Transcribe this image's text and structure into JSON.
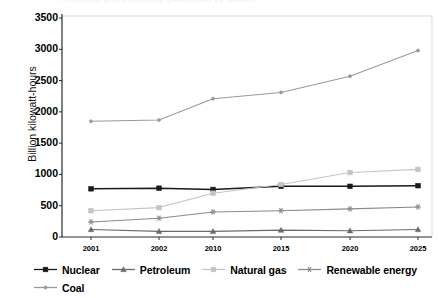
{
  "ghost_title": "Projected U.S. electricity generation by source",
  "chart_data": {
    "type": "line",
    "title": "",
    "xlabel": "",
    "ylabel": "Billion kilowatt-hours",
    "categories": [
      "2001",
      "2002",
      "2010",
      "2015",
      "2020",
      "2025"
    ],
    "ylim": [
      0,
      3500
    ],
    "yticks": [
      0,
      500,
      1000,
      1500,
      2000,
      2500,
      3000,
      3500
    ],
    "ytick_labels": [
      "0",
      "500",
      "1000",
      "1500",
      "2000",
      "2500",
      "3000",
      "3500"
    ],
    "grid": false,
    "legend_position": "bottom",
    "series": [
      {
        "name": "Nuclear",
        "color": "#1a1a1a",
        "marker": "square",
        "values": [
          770,
          780,
          760,
          810,
          810,
          820
        ]
      },
      {
        "name": "Petroleum",
        "color": "#6b6b6b",
        "marker": "triangle",
        "values": [
          120,
          90,
          90,
          110,
          100,
          120
        ]
      },
      {
        "name": "Natural gas",
        "color": "#c4c4c4",
        "marker": "square",
        "values": [
          420,
          470,
          700,
          840,
          1030,
          1080
        ]
      },
      {
        "name": "Renewable energy",
        "color": "#8a8a8a",
        "marker": "star",
        "values": [
          240,
          300,
          400,
          420,
          450,
          480
        ]
      },
      {
        "name": "Coal",
        "color": "#9a9a9a",
        "marker": "dot",
        "values": [
          1850,
          1870,
          2210,
          2310,
          2570,
          2980
        ]
      }
    ]
  }
}
